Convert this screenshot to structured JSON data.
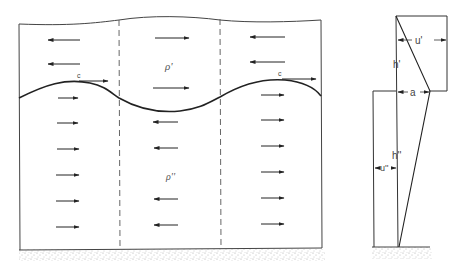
{
  "diagram": {
    "type": "two-layer stratified flow with interfacial wave",
    "left_panel": {
      "upper_layer_label": "ρ'",
      "lower_layer_label": "ρ''",
      "wave_speed_label": "c",
      "columns": [
        {
          "upper_arrows": [
            "left",
            "left"
          ],
          "lower_arrows": [
            "right",
            "right",
            "right",
            "right",
            "right",
            "right"
          ]
        },
        {
          "upper_arrows": [
            "right",
            "right"
          ],
          "lower_arrows": [
            "left",
            "left",
            "left",
            "left",
            "left"
          ]
        },
        {
          "upper_arrows": [
            "left",
            "left"
          ],
          "lower_arrows": [
            "right",
            "right",
            "right",
            "right",
            "right",
            "right"
          ]
        }
      ]
    },
    "right_panel": {
      "labels": {
        "upper_velocity": "u'",
        "upper_depth": "h'",
        "amplitude": "a",
        "lower_depth": "h''",
        "lower_velocity": "u''"
      }
    },
    "colors": {
      "line": "#333333",
      "arrow": "#222222",
      "dashed": "#555555",
      "ground": "#bbbbbb"
    }
  }
}
